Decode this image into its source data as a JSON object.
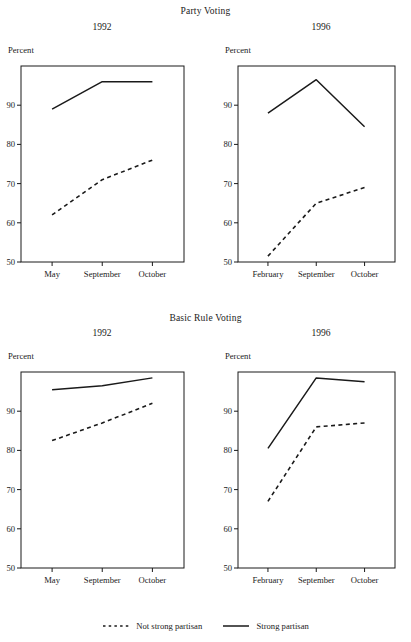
{
  "figure": {
    "sections": [
      {
        "id": "party-voting",
        "title": "Party Voting"
      },
      {
        "id": "basic-rule",
        "title": "Basic Rule Voting"
      }
    ],
    "axis_label": "Percent",
    "legend": [
      {
        "label": "Not strong partisan",
        "style": "dashed"
      },
      {
        "label": "Strong partisan",
        "style": "solid"
      }
    ],
    "color": "#1a1a1a"
  },
  "chart_data": [
    {
      "type": "line",
      "title": "Party Voting",
      "subtitle": "1992",
      "xlabel": "",
      "ylabel": "Percent",
      "categories": [
        "May",
        "September",
        "October"
      ],
      "ylim": [
        50,
        100
      ],
      "yticks": [
        50,
        60,
        70,
        80,
        90
      ],
      "grid": false,
      "legend_position": "bottom",
      "series": [
        {
          "name": "Strong partisan",
          "style": "solid",
          "values": [
            89,
            96,
            96
          ]
        },
        {
          "name": "Not strong partisan",
          "style": "dashed",
          "values": [
            62,
            71,
            76
          ]
        }
      ]
    },
    {
      "type": "line",
      "title": "Party Voting",
      "subtitle": "1996",
      "xlabel": "",
      "ylabel": "Percent",
      "categories": [
        "February",
        "September",
        "October"
      ],
      "ylim": [
        50,
        100
      ],
      "yticks": [
        50,
        60,
        70,
        80,
        90
      ],
      "grid": false,
      "legend_position": "bottom",
      "series": [
        {
          "name": "Strong partisan",
          "style": "solid",
          "values": [
            88,
            96.5,
            84.5
          ]
        },
        {
          "name": "Not strong partisan",
          "style": "dashed",
          "values": [
            51.5,
            65,
            69
          ]
        }
      ]
    },
    {
      "type": "line",
      "title": "Basic Rule Voting",
      "subtitle": "1992",
      "xlabel": "",
      "ylabel": "Percent",
      "categories": [
        "May",
        "September",
        "October"
      ],
      "ylim": [
        50,
        100
      ],
      "yticks": [
        50,
        60,
        70,
        80,
        90
      ],
      "grid": false,
      "legend_position": "bottom",
      "series": [
        {
          "name": "Strong partisan",
          "style": "solid",
          "values": [
            95.5,
            96.5,
            98.5
          ]
        },
        {
          "name": "Not strong partisan",
          "style": "dashed",
          "values": [
            82.5,
            87,
            92
          ]
        }
      ]
    },
    {
      "type": "line",
      "title": "Basic Rule Voting",
      "subtitle": "1996",
      "xlabel": "",
      "ylabel": "Percent",
      "categories": [
        "February",
        "September",
        "October"
      ],
      "ylim": [
        50,
        100
      ],
      "yticks": [
        50,
        60,
        70,
        80,
        90
      ],
      "grid": false,
      "legend_position": "bottom",
      "series": [
        {
          "name": "Strong partisan",
          "style": "solid",
          "values": [
            80.5,
            98.5,
            97.5
          ]
        },
        {
          "name": "Not strong partisan",
          "style": "dashed",
          "values": [
            67,
            86,
            87
          ]
        }
      ]
    }
  ]
}
